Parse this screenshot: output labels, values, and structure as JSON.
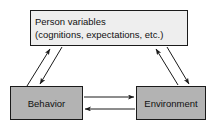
{
  "diagram": {
    "background_color": "#ffffff",
    "line_color": "#1a1a1a",
    "nodes": [
      {
        "id": "person",
        "lines": [
          "Person variables",
          "(cognitions, expectations, etc.)"
        ],
        "fill_color": "#eeeeee"
      },
      {
        "id": "behavior",
        "label": "Behavior",
        "fill_color": "#b3b3b3"
      },
      {
        "id": "environment",
        "label": "Environment",
        "fill_color": "#b3b3b3"
      }
    ],
    "edges": [
      {
        "id": "behavior-to-person",
        "from": "behavior",
        "to": "person",
        "direction": "up"
      },
      {
        "id": "person-to-behavior",
        "from": "person",
        "to": "behavior",
        "direction": "down"
      },
      {
        "id": "environment-to-person",
        "from": "environment",
        "to": "person",
        "direction": "up"
      },
      {
        "id": "person-to-environment",
        "from": "person",
        "to": "environment",
        "direction": "down"
      },
      {
        "id": "behavior-to-environment",
        "from": "behavior",
        "to": "environment",
        "direction": "right"
      },
      {
        "id": "environment-to-behavior",
        "from": "environment",
        "to": "behavior",
        "direction": "left"
      }
    ]
  }
}
